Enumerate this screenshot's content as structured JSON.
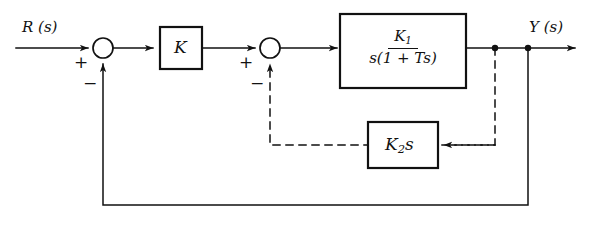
{
  "diagram": {
    "type": "control-system-block-diagram",
    "background_color": "#ffffff",
    "line_color": "#111111",
    "signals": {
      "input": {
        "label": "R (s)",
        "name": "reference-input"
      },
      "output": {
        "label": "Y (s)",
        "name": "system-output"
      }
    },
    "summing_junctions": [
      {
        "id": "sum1",
        "name": "summing-junction-outer",
        "signs": {
          "input": "+",
          "feedback": "−"
        },
        "cx": 103,
        "cy": 48,
        "r": 10
      },
      {
        "id": "sum2",
        "name": "summing-junction-inner",
        "signs": {
          "input": "+",
          "feedback": "−"
        },
        "cx": 270,
        "cy": 48,
        "r": 10
      }
    ],
    "blocks": [
      {
        "id": "gain",
        "name": "gain-block-k",
        "label": "K",
        "kind": "simple",
        "x": 160,
        "y": 27,
        "w": 42,
        "h": 42
      },
      {
        "id": "plant",
        "name": "plant-block-transfer-function",
        "kind": "fraction",
        "numerator": "K₁",
        "numerator_base": "K",
        "numerator_sub": "1",
        "denominator": "s(1 + Ts)",
        "x": 340,
        "y": 14,
        "w": 126,
        "h": 74
      },
      {
        "id": "rate-feedback",
        "name": "rate-feedback-block",
        "kind": "simple",
        "label": "K₂s",
        "label_base": "K",
        "label_sub": "2",
        "label_tail": "s",
        "x": 368,
        "y": 122,
        "w": 70,
        "h": 46
      }
    ],
    "takeoff_points": [
      {
        "name": "takeoff-inner-loop",
        "x": 495,
        "y": 48,
        "r": 3.2
      },
      {
        "name": "takeoff-outer-loop",
        "x": 528,
        "y": 48,
        "r": 3.2
      }
    ],
    "paths": [
      {
        "name": "path-input-to-sum1",
        "style": "solid"
      },
      {
        "name": "path-sum1-to-gain",
        "style": "solid"
      },
      {
        "name": "path-gain-to-sum2",
        "style": "solid"
      },
      {
        "name": "path-sum2-to-plant",
        "style": "solid"
      },
      {
        "name": "path-plant-to-output",
        "style": "solid"
      },
      {
        "name": "path-inner-feedback",
        "style": "dashed"
      },
      {
        "name": "path-outer-feedback",
        "style": "solid"
      }
    ]
  }
}
